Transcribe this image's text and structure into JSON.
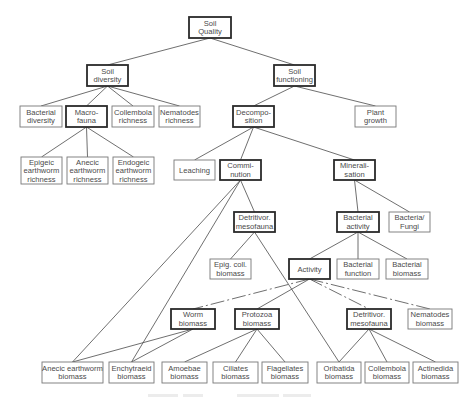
{
  "diagram": {
    "type": "hierarchy-tree",
    "nodes": [
      {
        "id": "soil_quality",
        "lines": [
          "Soil",
          "Quality"
        ],
        "x": 189,
        "y": 17,
        "w": 42,
        "h": 21,
        "bold": true
      },
      {
        "id": "soil_diversity",
        "lines": [
          "Soil",
          "diversity"
        ],
        "x": 87,
        "y": 65,
        "w": 41,
        "h": 21,
        "bold": true
      },
      {
        "id": "soil_functioning",
        "lines": [
          "Soil",
          "functioning"
        ],
        "x": 274,
        "y": 65,
        "w": 41,
        "h": 21,
        "bold": true
      },
      {
        "id": "bacterial_diversity",
        "lines": [
          "Bacterial",
          "diversity"
        ],
        "x": 20,
        "y": 106,
        "w": 42,
        "h": 21,
        "bold": false
      },
      {
        "id": "macro_fauna",
        "lines": [
          "Macro-",
          "fauna"
        ],
        "x": 66,
        "y": 106,
        "w": 41,
        "h": 21,
        "bold": true
      },
      {
        "id": "collembola_richness",
        "lines": [
          "Collembola",
          "richness"
        ],
        "x": 112,
        "y": 106,
        "w": 42,
        "h": 21,
        "bold": false
      },
      {
        "id": "nematodes_richness",
        "lines": [
          "Nematodes",
          "richness"
        ],
        "x": 159,
        "y": 106,
        "w": 41,
        "h": 21,
        "bold": false
      },
      {
        "id": "decomposition",
        "lines": [
          "Decompo-",
          "sition"
        ],
        "x": 233,
        "y": 106,
        "w": 41,
        "h": 21,
        "bold": true
      },
      {
        "id": "plant_growth",
        "lines": [
          "Plant",
          "growth"
        ],
        "x": 355,
        "y": 106,
        "w": 41,
        "h": 21,
        "bold": false
      },
      {
        "id": "epigeic_richness",
        "lines": [
          "Epigeic",
          "earthworm",
          "richness"
        ],
        "x": 21,
        "y": 157,
        "w": 41,
        "h": 27,
        "bold": false
      },
      {
        "id": "anecic_richness",
        "lines": [
          "Anecic",
          "earthworm",
          "richness"
        ],
        "x": 67,
        "y": 157,
        "w": 41,
        "h": 27,
        "bold": false
      },
      {
        "id": "endogeic_richness",
        "lines": [
          "Endogeic",
          "earthworm",
          "richness"
        ],
        "x": 113,
        "y": 157,
        "w": 41,
        "h": 27,
        "bold": false
      },
      {
        "id": "leaching",
        "lines": [
          "Leaching"
        ],
        "x": 174,
        "y": 160,
        "w": 41,
        "h": 20,
        "bold": false
      },
      {
        "id": "comminution",
        "lines": [
          "Commi-",
          "nution"
        ],
        "x": 220,
        "y": 160,
        "w": 41,
        "h": 20,
        "bold": true
      },
      {
        "id": "mineralisation",
        "lines": [
          "Minerali-",
          "sation"
        ],
        "x": 334,
        "y": 160,
        "w": 41,
        "h": 20,
        "bold": true
      },
      {
        "id": "detritivor_mesofauna_upper",
        "lines": [
          "Detritivor.",
          "mesofauna"
        ],
        "x": 234,
        "y": 212,
        "w": 41,
        "h": 20,
        "bold": true
      },
      {
        "id": "bacterial_activity",
        "lines": [
          "Bacterial",
          "activity"
        ],
        "x": 337,
        "y": 212,
        "w": 42,
        "h": 20,
        "bold": true
      },
      {
        "id": "bacteria_fungi",
        "lines": [
          "Bacteria/",
          "Fungi"
        ],
        "x": 389,
        "y": 212,
        "w": 41,
        "h": 20,
        "bold": false
      },
      {
        "id": "epig_coll_biomass",
        "lines": [
          "Epig. coll.",
          "biomass"
        ],
        "x": 210,
        "y": 259,
        "w": 41,
        "h": 20,
        "bold": false
      },
      {
        "id": "activity",
        "lines": [
          "Activity"
        ],
        "x": 289,
        "y": 259,
        "w": 41,
        "h": 20,
        "bold": true
      },
      {
        "id": "bacterial_function",
        "lines": [
          "Bacterial",
          "function"
        ],
        "x": 337,
        "y": 259,
        "w": 42,
        "h": 20,
        "bold": false
      },
      {
        "id": "bacterial_biomass",
        "lines": [
          "Bacterial",
          "biomass"
        ],
        "x": 386,
        "y": 259,
        "w": 42,
        "h": 20,
        "bold": false
      },
      {
        "id": "worm_biomass",
        "lines": [
          "Worm",
          "biomass"
        ],
        "x": 171,
        "y": 309,
        "w": 44,
        "h": 20,
        "bold": true
      },
      {
        "id": "protozoa_biomass",
        "lines": [
          "Protozoa",
          "biomass"
        ],
        "x": 235,
        "y": 309,
        "w": 44,
        "h": 20,
        "bold": true
      },
      {
        "id": "detritivor_mesofauna_lower",
        "lines": [
          "Detritivor.",
          "mesofauna"
        ],
        "x": 347,
        "y": 309,
        "w": 44,
        "h": 20,
        "bold": true
      },
      {
        "id": "nematodes_biomass",
        "lines": [
          "Nematodes",
          "biomass"
        ],
        "x": 408,
        "y": 309,
        "w": 44,
        "h": 20,
        "bold": false
      },
      {
        "id": "anecic_earthworm_biomass",
        "lines": [
          "Anecic earthworm",
          "biomass"
        ],
        "x": 42,
        "y": 362,
        "w": 61,
        "h": 21,
        "bold": false
      },
      {
        "id": "enchytraeid_biomass",
        "lines": [
          "Enchytraeid",
          "biomass"
        ],
        "x": 109,
        "y": 362,
        "w": 45,
        "h": 21,
        "bold": false
      },
      {
        "id": "amoebae_biomass",
        "lines": [
          "Amoebae",
          "biomass"
        ],
        "x": 162,
        "y": 362,
        "w": 45,
        "h": 21,
        "bold": false
      },
      {
        "id": "ciliates_biomass",
        "lines": [
          "Ciliates",
          "biomass"
        ],
        "x": 213,
        "y": 362,
        "w": 45,
        "h": 21,
        "bold": false
      },
      {
        "id": "flagellates_biomass",
        "lines": [
          "Flagellates",
          "biomass"
        ],
        "x": 262,
        "y": 362,
        "w": 46,
        "h": 21,
        "bold": false
      },
      {
        "id": "oribatida_biomass",
        "lines": [
          "Oribatida",
          "biomass"
        ],
        "x": 317,
        "y": 362,
        "w": 44,
        "h": 21,
        "bold": false
      },
      {
        "id": "collembola_biomass",
        "lines": [
          "Collembola",
          "biomass"
        ],
        "x": 365,
        "y": 362,
        "w": 44,
        "h": 21,
        "bold": false
      },
      {
        "id": "actinedida_biomass",
        "lines": [
          "Actinedida",
          "biomass"
        ],
        "x": 413,
        "y": 362,
        "w": 45,
        "h": 21,
        "bold": false
      }
    ],
    "edges": [
      {
        "from": "soil_quality",
        "to": "soil_diversity"
      },
      {
        "from": "soil_quality",
        "to": "soil_functioning"
      },
      {
        "from": "soil_diversity",
        "to": "bacterial_diversity"
      },
      {
        "from": "soil_diversity",
        "to": "macro_fauna"
      },
      {
        "from": "soil_diversity",
        "to": "collembola_richness"
      },
      {
        "from": "soil_diversity",
        "to": "nematodes_richness"
      },
      {
        "from": "soil_functioning",
        "to": "decomposition"
      },
      {
        "from": "soil_functioning",
        "to": "plant_growth"
      },
      {
        "from": "macro_fauna",
        "to": "epigeic_richness"
      },
      {
        "from": "macro_fauna",
        "to": "anecic_richness"
      },
      {
        "from": "macro_fauna",
        "to": "endogeic_richness"
      },
      {
        "from": "decomposition",
        "to": "leaching"
      },
      {
        "from": "decomposition",
        "to": "comminution"
      },
      {
        "from": "decomposition",
        "to": "mineralisation"
      },
      {
        "from": "comminution",
        "to": "detritivor_mesofauna_upper"
      },
      {
        "from": "comminution",
        "to": "anecic_earthworm_biomass"
      },
      {
        "from": "comminution",
        "to": "enchytraeid_biomass"
      },
      {
        "from": "mineralisation",
        "to": "bacterial_activity"
      },
      {
        "from": "mineralisation",
        "to": "bacteria_fungi"
      },
      {
        "from": "detritivor_mesofauna_upper",
        "to": "epig_coll_biomass"
      },
      {
        "from": "detritivor_mesofauna_upper",
        "to": "oribatida_biomass"
      },
      {
        "from": "bacterial_activity",
        "to": "activity"
      },
      {
        "from": "bacterial_activity",
        "to": "bacterial_function"
      },
      {
        "from": "bacterial_activity",
        "to": "bacterial_biomass"
      },
      {
        "from": "activity",
        "to": "worm_biomass",
        "dashed": true
      },
      {
        "from": "activity",
        "to": "protozoa_biomass"
      },
      {
        "from": "activity",
        "to": "detritivor_mesofauna_lower",
        "dashed": true
      },
      {
        "from": "activity",
        "to": "nematodes_biomass",
        "dashed": true
      },
      {
        "from": "worm_biomass",
        "to": "anecic_earthworm_biomass"
      },
      {
        "from": "worm_biomass",
        "to": "enchytraeid_biomass"
      },
      {
        "from": "protozoa_biomass",
        "to": "amoebae_biomass"
      },
      {
        "from": "protozoa_biomass",
        "to": "ciliates_biomass"
      },
      {
        "from": "protozoa_biomass",
        "to": "flagellates_biomass"
      },
      {
        "from": "detritivor_mesofauna_lower",
        "to": "oribatida_biomass"
      },
      {
        "from": "detritivor_mesofauna_lower",
        "to": "collembola_biomass"
      },
      {
        "from": "detritivor_mesofauna_lower",
        "to": "actinedida_biomass"
      }
    ]
  },
  "caption": {
    "legible": false,
    "bars": [
      {
        "x": 148,
        "w": 30
      },
      {
        "x": 183,
        "w": 20
      },
      {
        "x": 237,
        "w": 42
      },
      {
        "x": 283,
        "w": 28
      }
    ],
    "y": 396
  }
}
